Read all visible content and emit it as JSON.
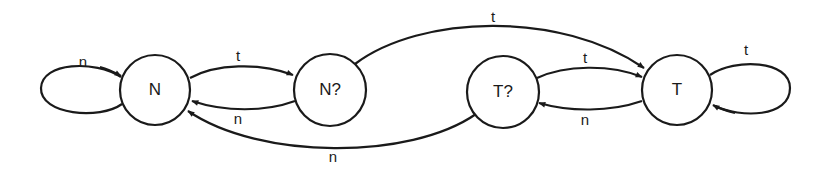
{
  "diagram": {
    "type": "state-machine",
    "states": [
      {
        "id": "N",
        "label": "N"
      },
      {
        "id": "Nq",
        "label": "N?"
      },
      {
        "id": "Tq",
        "label": "T?"
      },
      {
        "id": "T",
        "label": "T"
      }
    ],
    "transitions": [
      {
        "from": "N",
        "to": "N",
        "label": "n"
      },
      {
        "from": "N",
        "to": "Nq",
        "label": "t"
      },
      {
        "from": "Nq",
        "to": "N",
        "label": "n"
      },
      {
        "from": "Nq",
        "to": "T",
        "label": "t"
      },
      {
        "from": "Tq",
        "to": "T",
        "label": "t"
      },
      {
        "from": "T",
        "to": "Tq",
        "label": "n"
      },
      {
        "from": "Tq",
        "to": "N",
        "label": "n"
      },
      {
        "from": "T",
        "to": "T",
        "label": "t"
      }
    ]
  }
}
